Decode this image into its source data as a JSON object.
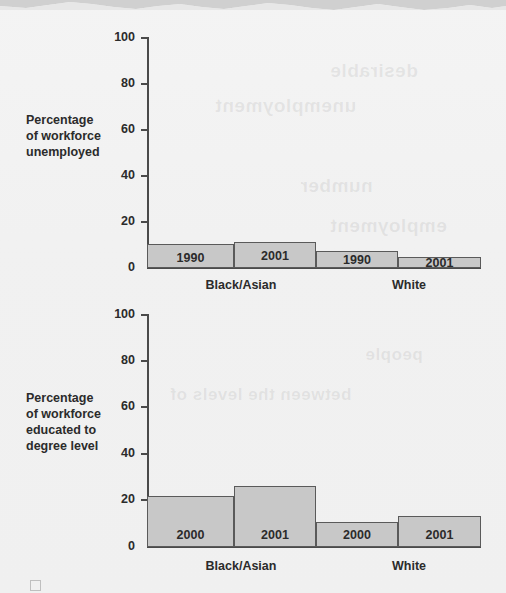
{
  "page": {
    "background_color": "#f1f1f1",
    "bar_fill_color": "#c8c8c8",
    "bar_stroke_color": "#5a5a5a",
    "text_color": "#2b2b2b"
  },
  "bleed_text": [
    {
      "text": "desirable",
      "x": 330,
      "y": 60,
      "size": 19
    },
    {
      "text": "unemployment",
      "x": 215,
      "y": 95,
      "size": 19
    },
    {
      "text": "number",
      "x": 300,
      "y": 175,
      "size": 19
    },
    {
      "text": "employment",
      "x": 330,
      "y": 215,
      "size": 19
    },
    {
      "text": "people",
      "x": 365,
      "y": 345,
      "size": 17
    },
    {
      "text": "between the levels of",
      "x": 170,
      "y": 385,
      "size": 17
    }
  ],
  "charts": [
    {
      "id": "unemployment-chart",
      "axis_title_lines": [
        "Percentage",
        "of workforce",
        "unemployed"
      ],
      "chart_data": {
        "type": "bar",
        "title": "",
        "xlabel": "",
        "ylabel": "Percentage of workforce unemployed",
        "ylim": [
          0,
          100
        ],
        "yticks": [
          0,
          20,
          40,
          60,
          80,
          100
        ],
        "ytick_labels": [
          "0",
          "20",
          "40",
          "60",
          "80",
          "100"
        ],
        "grid": false,
        "legend": "none",
        "groups": [
          "Black/Asian",
          "White"
        ],
        "categories": [
          "1990",
          "2001",
          "1990",
          "2001"
        ],
        "values": [
          10.5,
          11.5,
          7.5,
          5
        ],
        "series": [
          {
            "name": "Black/Asian 1990",
            "value": 10.5
          },
          {
            "name": "Black/Asian 2001",
            "value": 11.5
          },
          {
            "name": "White 1990",
            "value": 7.5
          },
          {
            "name": "White 2001",
            "value": 5
          }
        ]
      }
    },
    {
      "id": "degree-chart",
      "axis_title_lines": [
        "Percentage",
        "of workforce",
        "educated to",
        "degree level"
      ],
      "chart_data": {
        "type": "bar",
        "title": "",
        "xlabel": "",
        "ylabel": "Percentage of workforce educated to degree level",
        "ylim": [
          0,
          100
        ],
        "yticks": [
          0,
          20,
          40,
          60,
          80,
          100
        ],
        "ytick_labels": [
          "0",
          "20",
          "40",
          "60",
          "80",
          "100"
        ],
        "grid": false,
        "legend": "none",
        "groups": [
          "Black/Asian",
          "White"
        ],
        "categories": [
          "2000",
          "2001",
          "2000",
          "2001"
        ],
        "values": [
          22,
          26.5,
          11,
          13.5
        ],
        "series": [
          {
            "name": "Black/Asian 2000",
            "value": 22
          },
          {
            "name": "Black/Asian 2001",
            "value": 26.5
          },
          {
            "name": "White 2000",
            "value": 11
          },
          {
            "name": "White 2001",
            "value": 13.5
          }
        ]
      }
    }
  ]
}
